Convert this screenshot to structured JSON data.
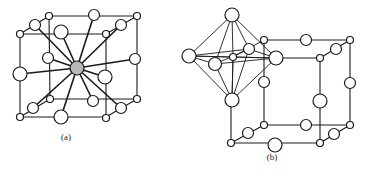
{
  "figures": [
    {
      "id": "a",
      "caption": "(a)",
      "caption_pos": [
        66,
        132
      ],
      "description": "Cubic unit cell with central shaded atom bonded to 12 surrounding atoms (cuboctahedral coordination)",
      "center_atom": {
        "x": 77,
        "y": 68,
        "r": 7,
        "fill": "#b8b8b8"
      },
      "thin_lines": [
        [
          20,
          34,
          106,
          34
        ],
        [
          49,
          16,
          137,
          16
        ],
        [
          20,
          34,
          49,
          16
        ],
        [
          106,
          34,
          137,
          16
        ],
        [
          20,
          117,
          106,
          117
        ],
        [
          50,
          99,
          137,
          99
        ],
        [
          20,
          117,
          50,
          99
        ],
        [
          106,
          117,
          137,
          99
        ],
        [
          20,
          34,
          20,
          117
        ],
        [
          106,
          34,
          106,
          117
        ],
        [
          137,
          16,
          137,
          99
        ],
        [
          49,
          16,
          50,
          99
        ]
      ],
      "bonds": [
        [
          77,
          68,
          61,
          32
        ],
        [
          77,
          68,
          94,
          15
        ],
        [
          77,
          68,
          35,
          25
        ],
        [
          77,
          68,
          121,
          25
        ],
        [
          77,
          68,
          48,
          58
        ],
        [
          77,
          68,
          135,
          59
        ],
        [
          77,
          68,
          20,
          74
        ],
        [
          77,
          68,
          105,
          77
        ],
        [
          77,
          68,
          61,
          117
        ],
        [
          77,
          68,
          93,
          101
        ],
        [
          77,
          68,
          33,
          108
        ],
        [
          77,
          68,
          121,
          108
        ]
      ],
      "atoms": [
        {
          "x": 49,
          "y": 16,
          "r": 3.5
        },
        {
          "x": 20,
          "y": 34,
          "r": 3.5
        },
        {
          "x": 137,
          "y": 16,
          "r": 3.5
        },
        {
          "x": 106,
          "y": 34,
          "r": 3.5
        },
        {
          "x": 50,
          "y": 99,
          "r": 3.5
        },
        {
          "x": 20,
          "y": 117,
          "r": 3.5
        },
        {
          "x": 137,
          "y": 99,
          "r": 3.5
        },
        {
          "x": 106,
          "y": 118,
          "r": 3.5
        },
        {
          "x": 35,
          "y": 25,
          "r": 5.5
        },
        {
          "x": 121,
          "y": 25,
          "r": 5.5
        },
        {
          "x": 33,
          "y": 108,
          "r": 5.5
        },
        {
          "x": 121,
          "y": 108,
          "r": 5.5
        },
        {
          "x": 94,
          "y": 15,
          "r": 5.5
        },
        {
          "x": 93,
          "y": 101,
          "r": 5.5
        },
        {
          "x": 48,
          "y": 58,
          "r": 5.5
        },
        {
          "x": 135,
          "y": 59,
          "r": 5.5
        },
        {
          "x": 61,
          "y": 32,
          "r": 7
        },
        {
          "x": 61,
          "y": 117,
          "r": 7
        },
        {
          "x": 20,
          "y": 74,
          "r": 7
        },
        {
          "x": 105,
          "y": 77,
          "r": 7
        }
      ]
    },
    {
      "id": "b",
      "caption": "(b)",
      "caption_pos": [
        272,
        152
      ],
      "description": "Cubic unit cell with an octahedron of six atoms around a small central atom at one corner",
      "thin_lines": [
        [
          231,
          143,
          320,
          143
        ],
        [
          264,
          125,
          350,
          125
        ],
        [
          231,
          143,
          264,
          125
        ],
        [
          320,
          143,
          350,
          125
        ],
        [
          264,
          40,
          350,
          40
        ],
        [
          320,
          58,
          350,
          40
        ],
        [
          276,
          58,
          320,
          58
        ],
        [
          231,
          100,
          231,
          143
        ],
        [
          320,
          58,
          320,
          143
        ],
        [
          350,
          40,
          350,
          125
        ],
        [
          264,
          40,
          264,
          125
        ]
      ],
      "octahedron_lines": [
        [
          232,
          15,
          189,
          56
        ],
        [
          232,
          15,
          276,
          58
        ],
        [
          232,
          15,
          215,
          64
        ],
        [
          232,
          15,
          249,
          49
        ],
        [
          232,
          15,
          233,
          57
        ],
        [
          232,
          100,
          189,
          56
        ],
        [
          232,
          100,
          276,
          58
        ],
        [
          232,
          100,
          215,
          64
        ],
        [
          232,
          100,
          249,
          49
        ],
        [
          232,
          100,
          233,
          57
        ],
        [
          189,
          56,
          215,
          64
        ],
        [
          215,
          64,
          276,
          58
        ],
        [
          276,
          58,
          249,
          49
        ],
        [
          249,
          49,
          189,
          56
        ],
        [
          189,
          56,
          276,
          58
        ],
        [
          215,
          64,
          249,
          49
        ],
        [
          233,
          57,
          232,
          100
        ],
        [
          189,
          56,
          233,
          57
        ],
        [
          233,
          57,
          276,
          58
        ],
        [
          264,
          40,
          233,
          57
        ]
      ],
      "atoms": [
        {
          "x": 233,
          "y": 57,
          "r": 3.5
        },
        {
          "x": 264,
          "y": 40,
          "r": 3.5
        },
        {
          "x": 350,
          "y": 40,
          "r": 3.5
        },
        {
          "x": 320,
          "y": 58,
          "r": 3.5
        },
        {
          "x": 264,
          "y": 125,
          "r": 3.5
        },
        {
          "x": 231,
          "y": 143,
          "r": 3.5
        },
        {
          "x": 350,
          "y": 125,
          "r": 3.5
        },
        {
          "x": 320,
          "y": 143,
          "r": 3.5
        },
        {
          "x": 249,
          "y": 49,
          "r": 5.5
        },
        {
          "x": 336,
          "y": 49,
          "r": 5.5
        },
        {
          "x": 248,
          "y": 133,
          "r": 5.5
        },
        {
          "x": 334,
          "y": 134,
          "r": 5.5
        },
        {
          "x": 306,
          "y": 40,
          "r": 5.5
        },
        {
          "x": 306,
          "y": 125,
          "r": 5.5
        },
        {
          "x": 264,
          "y": 82,
          "r": 5.5
        },
        {
          "x": 350,
          "y": 83,
          "r": 5.5
        },
        {
          "x": 232,
          "y": 15,
          "r": 7
        },
        {
          "x": 232,
          "y": 100,
          "r": 7
        },
        {
          "x": 189,
          "y": 56,
          "r": 7
        },
        {
          "x": 276,
          "y": 58,
          "r": 7
        },
        {
          "x": 215,
          "y": 64,
          "r": 6.5
        },
        {
          "x": 275,
          "y": 145,
          "r": 7
        },
        {
          "x": 320,
          "y": 101,
          "r": 7
        }
      ]
    }
  ],
  "colors": {
    "stroke": "#1a1a1a",
    "atom_fill": "#ffffff",
    "background": "#ffffff"
  }
}
